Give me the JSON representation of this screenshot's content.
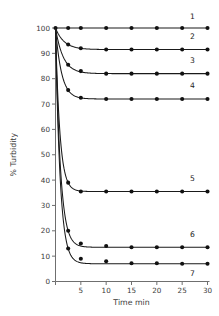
{
  "chart_data": {
    "type": "line",
    "title": "",
    "subtitle": "",
    "xlabel": "Time  min",
    "ylabel": "% Turbidity",
    "xlim": [
      0,
      30
    ],
    "ylim": [
      0,
      100
    ],
    "xticks": [
      0,
      5,
      10,
      15,
      20,
      25,
      30
    ],
    "xticklabels": [
      "",
      "5",
      "10",
      "15",
      "20",
      "25",
      "30"
    ],
    "yticks": [
      0,
      10,
      20,
      30,
      40,
      50,
      60,
      70,
      80,
      90,
      100
    ],
    "yticklabels": [
      "0",
      "10",
      "20",
      "30",
      "40",
      "50",
      "60",
      "70",
      "80",
      "90",
      "100"
    ],
    "grid": false,
    "legend_position": "inline-right-of-curve",
    "marker": "filled-circle",
    "line_color": "#1a1a1a",
    "marker_color": "#111111",
    "axis_color": "#6f6f6f",
    "background": "#ffffff",
    "x": [
      0,
      2.5,
      5,
      10,
      15,
      20,
      25,
      30
    ],
    "series": [
      {
        "name": "1",
        "label": "1",
        "plateau": 100,
        "values": [
          100,
          100,
          100,
          100,
          100,
          100,
          100,
          100
        ]
      },
      {
        "name": "2",
        "label": "2",
        "plateau": 91.5,
        "values": [
          100,
          93.5,
          92.0,
          91.5,
          91.5,
          91.5,
          91.5,
          91.5
        ]
      },
      {
        "name": "3",
        "label": "3",
        "plateau": 82.0,
        "values": [
          100,
          85.5,
          83.0,
          82.0,
          82.0,
          82.0,
          82.0,
          82.0
        ]
      },
      {
        "name": "4",
        "label": "4",
        "plateau": 72.0,
        "values": [
          100,
          75.5,
          72.5,
          72.0,
          72.0,
          72.0,
          72.0,
          72.0
        ]
      },
      {
        "name": "5",
        "label": "5",
        "plateau": 35.5,
        "values": [
          100,
          39.0,
          35.5,
          35.5,
          35.5,
          35.5,
          35.5,
          35.5
        ]
      },
      {
        "name": "6",
        "label": "6",
        "plateau": 13.5,
        "values": [
          100,
          20.0,
          15.0,
          14.0,
          13.5,
          13.5,
          13.5,
          13.5
        ]
      },
      {
        "name": "7",
        "label": "7",
        "plateau": 7.0,
        "values": [
          100,
          13.0,
          9.0,
          8.0,
          7.2,
          7.2,
          7.0,
          7.0
        ]
      }
    ],
    "series_label_positions": [
      {
        "label": "1",
        "x": 27.0,
        "y": 103.5
      },
      {
        "label": "2",
        "x": 27.0,
        "y": 95.5
      },
      {
        "label": "3",
        "x": 27.0,
        "y": 86.0
      },
      {
        "label": "4",
        "x": 27.0,
        "y": 76.5
      },
      {
        "label": "5",
        "x": 27.0,
        "y": 39.5
      },
      {
        "label": "6",
        "x": 27.0,
        "y": 17.5
      },
      {
        "label": "7",
        "x": 27.0,
        "y": 2.0
      }
    ]
  }
}
